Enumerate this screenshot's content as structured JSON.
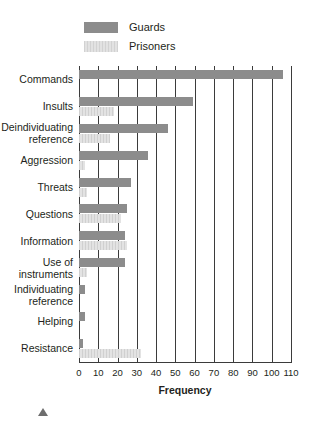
{
  "legend": {
    "items": [
      {
        "label": "Guards",
        "color": "#8c8c8c",
        "icon": "legend-swatch-guards"
      },
      {
        "label": "Prisoners",
        "color": "#d9d9d9",
        "icon": "legend-swatch-prisoners"
      }
    ]
  },
  "footer": {
    "marker_icon": "triangle-up-icon"
  },
  "chart_data": {
    "type": "bar",
    "orientation": "horizontal",
    "title": "",
    "xlabel": "Frequency",
    "ylabel": "",
    "xlim": [
      0,
      110
    ],
    "xticks": [
      0,
      10,
      20,
      30,
      40,
      50,
      60,
      70,
      80,
      90,
      100,
      110
    ],
    "xtick_labels": [
      "0",
      "10",
      "20",
      "30",
      "40",
      "50",
      "60",
      "70",
      "80",
      "90",
      "100",
      "110"
    ],
    "grid": true,
    "grid_axis": "x",
    "legend_position": "top-left",
    "categories": [
      "Commands",
      "Insults",
      "Deindividuating reference",
      "Aggression",
      "Threats",
      "Questions",
      "Information",
      "Use of instruments",
      "Individuating reference",
      "Helping",
      "Resistance"
    ],
    "category_lines": [
      [
        "Commands"
      ],
      [
        "Insults"
      ],
      [
        "Deindividuating",
        "reference"
      ],
      [
        "Aggression"
      ],
      [
        "Threats"
      ],
      [
        "Questions"
      ],
      [
        "Information"
      ],
      [
        "Use of",
        "instruments"
      ],
      [
        "Individuating",
        "reference"
      ],
      [
        "Helping"
      ],
      [
        "Resistance"
      ]
    ],
    "series": [
      {
        "name": "Guards",
        "color": "#8c8c8c",
        "values": [
          106,
          59,
          46,
          36,
          27,
          25,
          24,
          24,
          3,
          3,
          2
        ]
      },
      {
        "name": "Prisoners",
        "color": "#d9d9d9",
        "values": [
          0,
          18,
          16,
          3,
          4,
          22,
          25,
          4,
          0,
          0,
          32
        ]
      }
    ]
  }
}
